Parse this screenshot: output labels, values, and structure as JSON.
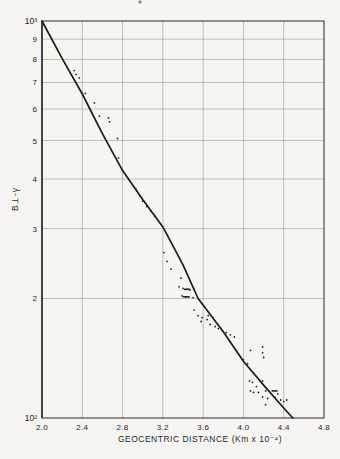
{
  "figure": {
    "xlabel": "GEOCENTRIC DISTANCE (Km x 10⁻⁴)",
    "ylabel": "B⊥-γ"
  },
  "chart_data": {
    "type": "scatter",
    "title": "",
    "xlabel": "GEOCENTRIC DISTANCE (Km x 10⁻⁴)",
    "ylabel": "B⊥-γ",
    "x_scale": "linear",
    "y_scale": "log",
    "xlim": [
      2.0,
      4.8
    ],
    "ylim": [
      100,
      1000
    ],
    "grid": "on",
    "x_ticks": [
      {
        "value": 2.0,
        "label": "2.0"
      },
      {
        "value": 2.4,
        "label": "2.4"
      },
      {
        "value": 2.8,
        "label": "2.8"
      },
      {
        "value": 3.2,
        "label": "3.2"
      },
      {
        "value": 3.6,
        "label": "3.6"
      },
      {
        "value": 4.0,
        "label": "4.0"
      },
      {
        "value": 4.4,
        "label": "4.4"
      },
      {
        "value": 4.8,
        "label": "4.8"
      }
    ],
    "y_ticks": [
      {
        "value": 1000,
        "label": "10³"
      },
      {
        "value": 900,
        "label": "9"
      },
      {
        "value": 800,
        "label": "8"
      },
      {
        "value": 700,
        "label": "7"
      },
      {
        "value": 600,
        "label": "6"
      },
      {
        "value": 500,
        "label": "5"
      },
      {
        "value": 400,
        "label": "4"
      },
      {
        "value": 300,
        "label": "3"
      },
      {
        "value": 200,
        "label": "2"
      },
      {
        "value": 100,
        "label": "10²"
      }
    ],
    "x_grid_values": [
      2.4,
      2.8,
      3.2,
      3.6,
      4.0,
      4.4
    ],
    "y_grid_values": [
      900,
      800,
      700,
      600,
      500,
      400,
      300,
      200
    ],
    "series": [
      {
        "name": "fit-curve",
        "type": "line",
        "points": [
          [
            2.0,
            1000
          ],
          [
            2.2,
            805
          ],
          [
            2.4,
            655
          ],
          [
            2.6,
            520
          ],
          [
            2.8,
            420
          ],
          [
            3.0,
            355
          ],
          [
            3.2,
            303
          ],
          [
            3.4,
            243
          ],
          [
            3.55,
            200
          ],
          [
            3.8,
            165
          ],
          [
            4.0,
            139
          ],
          [
            4.2,
            121
          ],
          [
            4.4,
            106
          ],
          [
            4.49,
            100
          ]
        ]
      },
      {
        "name": "observations",
        "type": "scatter",
        "points": [
          [
            2.32,
            750
          ],
          [
            2.34,
            733
          ],
          [
            2.37,
            719
          ],
          [
            2.43,
            657
          ],
          [
            2.52,
            622
          ],
          [
            2.57,
            576
          ],
          [
            2.66,
            570
          ],
          [
            2.67,
            557
          ],
          [
            2.75,
            506
          ],
          [
            2.76,
            452
          ],
          [
            2.93,
            378
          ],
          [
            2.97,
            363
          ],
          [
            3.0,
            352
          ],
          [
            3.04,
            341
          ],
          [
            3.08,
            332
          ],
          [
            3.12,
            322
          ],
          [
            3.21,
            261
          ],
          [
            3.24,
            248
          ],
          [
            3.28,
            237
          ],
          [
            3.36,
            214
          ],
          [
            3.38,
            225
          ],
          [
            3.4,
            212
          ],
          [
            3.44,
            211
          ],
          [
            3.47,
            210
          ],
          [
            3.51,
            211
          ],
          [
            3.39,
            203
          ],
          [
            3.43,
            202
          ],
          [
            3.46,
            202
          ],
          [
            3.5,
            201
          ],
          [
            3.51,
            187
          ],
          [
            3.55,
            181
          ],
          [
            3.58,
            175
          ],
          [
            3.59,
            179
          ],
          [
            3.64,
            177
          ],
          [
            3.65,
            181
          ],
          [
            3.67,
            172
          ],
          [
            3.7,
            179
          ],
          [
            3.72,
            170
          ],
          [
            3.75,
            168
          ],
          [
            3.79,
            166
          ],
          [
            3.83,
            164
          ],
          [
            3.87,
            162
          ],
          [
            3.91,
            160
          ],
          [
            4.0,
            140
          ],
          [
            4.04,
            137
          ],
          [
            4.06,
            124
          ],
          [
            4.07,
            148
          ],
          [
            4.09,
            123
          ],
          [
            4.19,
            151
          ],
          [
            4.19,
            146
          ],
          [
            4.2,
            142
          ],
          [
            4.19,
            124
          ],
          [
            4.07,
            117
          ],
          [
            4.1,
            116
          ],
          [
            4.15,
            116
          ],
          [
            4.13,
            120
          ],
          [
            4.19,
            113
          ],
          [
            4.22,
            117
          ],
          [
            4.24,
            112
          ],
          [
            4.22,
            108
          ],
          [
            4.31,
            113
          ],
          [
            4.34,
            115
          ],
          [
            4.37,
            111
          ],
          [
            4.4,
            110
          ],
          [
            4.43,
            111
          ]
        ]
      },
      {
        "name": "observation-dashes",
        "type": "dash",
        "points": [
          [
            3.44,
            211
          ],
          [
            3.43,
            202
          ],
          [
            4.31,
            117
          ]
        ]
      }
    ],
    "layout": {
      "plot_left": 42,
      "plot_right": 324,
      "plot_top": 21,
      "plot_bottom": 418
    },
    "colors": {
      "paper": "#f6f5f2",
      "ink": "#1c1c1c",
      "grid": "#919191",
      "frame": "#3c3c3c"
    }
  }
}
